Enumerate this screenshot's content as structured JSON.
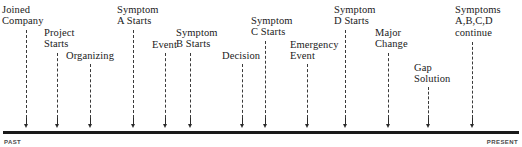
{
  "figure": {
    "type": "timeline",
    "axis": {
      "start_caption": "PAST",
      "end_caption": "PRESENT",
      "line_color": "#1a1a1a"
    },
    "events": [
      {
        "label": "Joined\nCompany",
        "x": 26,
        "label_x": 2,
        "label_y": 4,
        "leader_top": 30
      },
      {
        "label": "Project\nStarts",
        "x": 57,
        "label_x": 44,
        "label_y": 27,
        "leader_top": 53
      },
      {
        "label": "Organizing",
        "x": 90,
        "label_x": 66,
        "label_y": 50,
        "leader_top": 64
      },
      {
        "label": "Symptom\nA Starts",
        "x": 133,
        "label_x": 117,
        "label_y": 4,
        "leader_top": 30
      },
      {
        "label": "Event",
        "x": 165,
        "label_x": 152,
        "label_y": 39,
        "leader_top": 53
      },
      {
        "label": "Symptom\nB Starts",
        "x": 190,
        "label_x": 176,
        "label_y": 27,
        "leader_top": 53
      },
      {
        "label": "Decision",
        "x": 242,
        "label_x": 222,
        "label_y": 50,
        "leader_top": 64
      },
      {
        "label": "Symptom\nC Starts",
        "x": 265,
        "label_x": 251,
        "label_y": 15,
        "leader_top": 41
      },
      {
        "label": "Emergency\nEvent",
        "x": 307,
        "label_x": 290,
        "label_y": 39,
        "leader_top": 64
      },
      {
        "label": "Symptom\nD Starts",
        "x": 345,
        "label_x": 334,
        "label_y": 4,
        "leader_top": 30
      },
      {
        "label": "Major\nChange",
        "x": 388,
        "label_x": 375,
        "label_y": 27,
        "leader_top": 53
      },
      {
        "label": "Gap\nSolution",
        "x": 428,
        "label_x": 414,
        "label_y": 62,
        "leader_top": 87
      },
      {
        "label": "Symptoms\nA,B,C,D\ncontinue",
        "x": 472,
        "label_x": 455,
        "label_y": 4,
        "leader_top": 42
      }
    ]
  }
}
